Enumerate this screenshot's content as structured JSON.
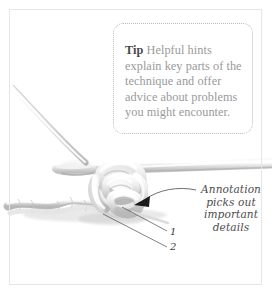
{
  "page": {
    "background_color": "#ffffff",
    "frame_color": "#e6e6e6"
  },
  "tip": {
    "label": "Tip",
    "body": " Helpful hints explain key parts of the technique and offer advice about problems you might encounter.",
    "full_text": "Tip Helpful hints explain key parts of the technique and offer advice about problems you might encounter.",
    "label_color": "#4a4a4a",
    "body_color": "#9a9a9a",
    "border_color": "#b9b9b9",
    "border_style": "dotted"
  },
  "annotation": {
    "lines": [
      "Annotation",
      "picks out",
      "important",
      "details"
    ],
    "full_text": "Annotation picks out important details",
    "text_color": "#4d4d4d",
    "arrow_color": "#1a1a1a"
  },
  "leaders": {
    "labels": [
      {
        "id": "1",
        "text": "1"
      },
      {
        "id": "2",
        "text": "2"
      }
    ],
    "line_color": "#4a4a4a"
  },
  "illustration": {
    "subject": "crochet-hook-with-yarn-stitch",
    "yarn_color": "#d8d8d8",
    "yarn_shadow_color": "#b0b0b0",
    "hook_color": "#cfcfcf",
    "elements": [
      "crochet-hook-shaft",
      "hook-head",
      "yarn-working-strand",
      "yarn-chain-row",
      "yarn-loop-cluster"
    ]
  }
}
